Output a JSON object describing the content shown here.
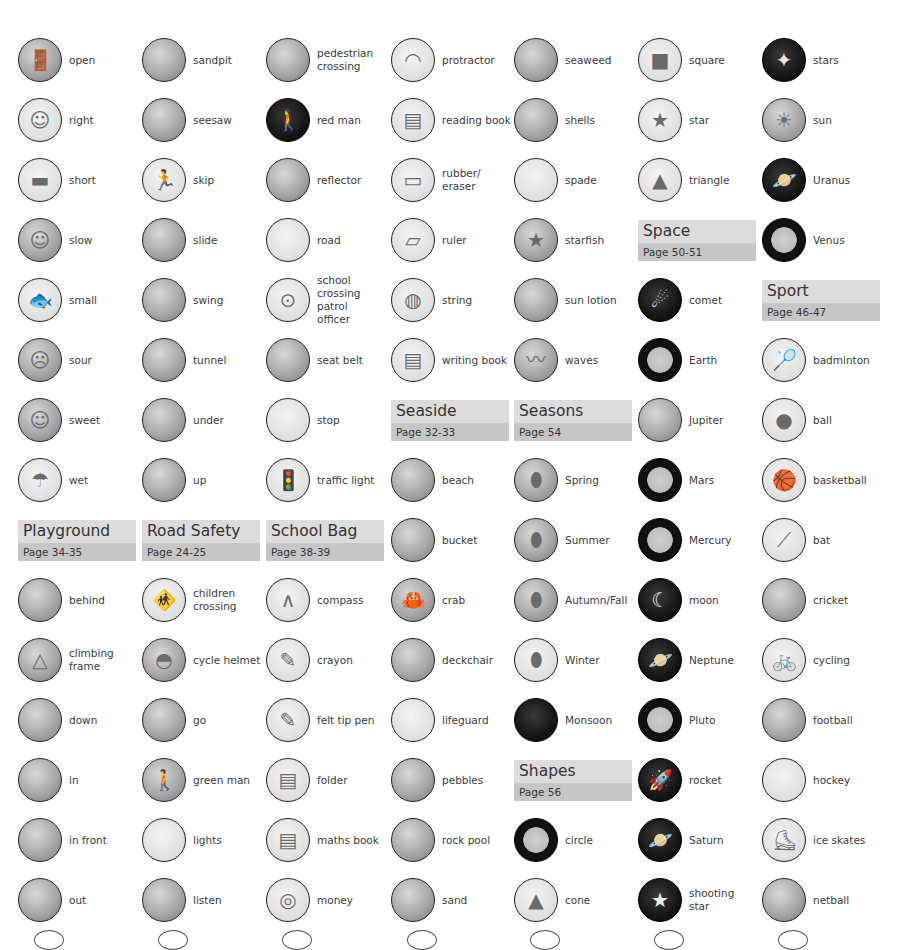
{
  "columns": [
    {
      "entries": [
        {
          "type": "word",
          "label": "open",
          "icon": "open-door-picture",
          "style": "photo",
          "glyph": "🚪"
        },
        {
          "type": "word",
          "label": "right",
          "icon": "right-picture",
          "style": "light",
          "glyph": "☺"
        },
        {
          "type": "word",
          "label": "short",
          "icon": "short-picture",
          "style": "light",
          "glyph": "▬"
        },
        {
          "type": "word",
          "label": "slow",
          "icon": "slow-picture",
          "style": "photo",
          "glyph": "☺"
        },
        {
          "type": "word",
          "label": "small",
          "icon": "small-fish-picture",
          "style": "light",
          "glyph": "🐟"
        },
        {
          "type": "word",
          "label": "sour",
          "icon": "sour-face-picture",
          "style": "photo",
          "glyph": "☹"
        },
        {
          "type": "word",
          "label": "sweet",
          "icon": "sweet-face-picture",
          "style": "photo",
          "glyph": "☺"
        },
        {
          "type": "word",
          "label": "wet",
          "icon": "wet-rain-picture",
          "style": "light",
          "glyph": "☂"
        },
        {
          "type": "section",
          "title": "Playground",
          "page": "Page 34-35"
        },
        {
          "type": "word",
          "label": "behind",
          "icon": "behind-picture",
          "style": "photo",
          "glyph": ""
        },
        {
          "type": "word",
          "label": "climbing\nframe",
          "icon": "climbing-frame-picture",
          "style": "photo",
          "glyph": "△"
        },
        {
          "type": "word",
          "label": "down",
          "icon": "down-slide-picture",
          "style": "photo",
          "glyph": ""
        },
        {
          "type": "word",
          "label": "in",
          "icon": "in-picture",
          "style": "photo",
          "glyph": ""
        },
        {
          "type": "word",
          "label": "in front",
          "icon": "in-front-picture",
          "style": "photo",
          "glyph": ""
        },
        {
          "type": "word",
          "label": "out",
          "icon": "out-picture",
          "style": "photo",
          "glyph": ""
        }
      ]
    },
    {
      "entries": [
        {
          "type": "word",
          "label": "sandpit",
          "icon": "sandpit-picture",
          "style": "photo",
          "glyph": ""
        },
        {
          "type": "word",
          "label": "seesaw",
          "icon": "seesaw-picture",
          "style": "photo",
          "glyph": ""
        },
        {
          "type": "word",
          "label": "skip",
          "icon": "skip-picture",
          "style": "light",
          "glyph": "🏃"
        },
        {
          "type": "word",
          "label": "slide",
          "icon": "slide-picture",
          "style": "photo",
          "glyph": ""
        },
        {
          "type": "word",
          "label": "swing",
          "icon": "swing-picture",
          "style": "photo",
          "glyph": ""
        },
        {
          "type": "word",
          "label": "tunnel",
          "icon": "tunnel-picture",
          "style": "photo",
          "glyph": ""
        },
        {
          "type": "word",
          "label": "under",
          "icon": "under-picture",
          "style": "photo",
          "glyph": ""
        },
        {
          "type": "word",
          "label": "up",
          "icon": "up-picture",
          "style": "photo",
          "glyph": ""
        },
        {
          "type": "section",
          "title": "Road Safety",
          "page": "Page 24-25"
        },
        {
          "type": "word",
          "label": "children\ncrossing",
          "icon": "children-crossing-picture",
          "style": "light",
          "glyph": "🚸"
        },
        {
          "type": "word",
          "label": "cycle helmet",
          "icon": "cycle-helmet-picture",
          "style": "photo",
          "glyph": "◓"
        },
        {
          "type": "word",
          "label": "go",
          "icon": "go-picture",
          "style": "photo",
          "glyph": ""
        },
        {
          "type": "word",
          "label": "green man",
          "icon": "green-man-signal-picture",
          "style": "photo",
          "glyph": "🚶"
        },
        {
          "type": "word",
          "label": "lights",
          "icon": "lights-picture",
          "style": "light",
          "glyph": ""
        },
        {
          "type": "word",
          "label": "listen",
          "icon": "listen-ear-picture",
          "style": "photo",
          "glyph": ""
        }
      ]
    },
    {
      "entries": [
        {
          "type": "word",
          "label": "pedestrian\ncrossing",
          "icon": "pedestrian-crossing-picture",
          "style": "photo",
          "glyph": ""
        },
        {
          "type": "word",
          "label": "red man",
          "icon": "red-man-signal-picture",
          "style": "dark",
          "glyph": "🚶"
        },
        {
          "type": "word",
          "label": "reflector",
          "icon": "reflector-picture",
          "style": "photo",
          "glyph": ""
        },
        {
          "type": "word",
          "label": "road",
          "icon": "road-picture",
          "style": "light",
          "glyph": ""
        },
        {
          "type": "word",
          "label": "school\ncrossing\npatrol\nofficer",
          "icon": "school-crossing-patrol-picture",
          "style": "light",
          "glyph": "⊙"
        },
        {
          "type": "word",
          "label": "seat belt",
          "icon": "seat-belt-picture",
          "style": "photo",
          "glyph": ""
        },
        {
          "type": "word",
          "label": "stop",
          "icon": "stop-picture",
          "style": "light",
          "glyph": ""
        },
        {
          "type": "word",
          "label": "traffic light",
          "icon": "traffic-light-picture",
          "style": "light",
          "glyph": "🚦"
        },
        {
          "type": "section",
          "title": "School Bag",
          "page": "Page 38-39"
        },
        {
          "type": "word",
          "label": "compass",
          "icon": "compass-picture",
          "style": "light",
          "glyph": "∧"
        },
        {
          "type": "word",
          "label": "crayon",
          "icon": "crayon-picture",
          "style": "light",
          "glyph": "✎"
        },
        {
          "type": "word",
          "label": "felt tip pen",
          "icon": "felt-tip-pen-picture",
          "style": "light",
          "glyph": "✎"
        },
        {
          "type": "word",
          "label": "folder",
          "icon": "folder-picture",
          "style": "light",
          "glyph": "▤"
        },
        {
          "type": "word",
          "label": "maths book",
          "icon": "maths-book-picture",
          "style": "light",
          "glyph": "▤"
        },
        {
          "type": "word",
          "label": "money",
          "icon": "money-coins-picture",
          "style": "light",
          "glyph": "◎"
        }
      ]
    },
    {
      "entries": [
        {
          "type": "word",
          "label": "protractor",
          "icon": "protractor-picture",
          "style": "light",
          "glyph": "◠"
        },
        {
          "type": "word",
          "label": "reading book",
          "icon": "reading-book-picture",
          "style": "light",
          "glyph": "▤"
        },
        {
          "type": "word",
          "label": "rubber/\neraser",
          "icon": "rubber-eraser-picture",
          "style": "light",
          "glyph": "▭"
        },
        {
          "type": "word",
          "label": "ruler",
          "icon": "ruler-picture",
          "style": "light",
          "glyph": "▱"
        },
        {
          "type": "word",
          "label": "string",
          "icon": "string-picture",
          "style": "light",
          "glyph": "◍"
        },
        {
          "type": "word",
          "label": "writing book",
          "icon": "writing-book-picture",
          "style": "light",
          "glyph": "▤"
        },
        {
          "type": "section",
          "title": "Seaside",
          "page": "Page 32-33"
        },
        {
          "type": "word",
          "label": "beach",
          "icon": "beach-picture",
          "style": "photo",
          "glyph": ""
        },
        {
          "type": "word",
          "label": "bucket",
          "icon": "bucket-picture",
          "style": "photo",
          "glyph": ""
        },
        {
          "type": "word",
          "label": "crab",
          "icon": "crab-picture",
          "style": "photo",
          "glyph": "🦀"
        },
        {
          "type": "word",
          "label": "deckchair",
          "icon": "deckchair-picture",
          "style": "photo",
          "glyph": ""
        },
        {
          "type": "word",
          "label": "lifeguard",
          "icon": "lifeguard-picture",
          "style": "light",
          "glyph": ""
        },
        {
          "type": "word",
          "label": "pebbles",
          "icon": "pebbles-picture",
          "style": "photo",
          "glyph": ""
        },
        {
          "type": "word",
          "label": "rock pool",
          "icon": "rock-pool-picture",
          "style": "photo",
          "glyph": ""
        },
        {
          "type": "word",
          "label": "sand",
          "icon": "sand-picture",
          "style": "photo",
          "glyph": ""
        }
      ]
    },
    {
      "entries": [
        {
          "type": "word",
          "label": "seaweed",
          "icon": "seaweed-picture",
          "style": "photo",
          "glyph": ""
        },
        {
          "type": "word",
          "label": "shells",
          "icon": "shells-picture",
          "style": "photo",
          "glyph": ""
        },
        {
          "type": "word",
          "label": "spade",
          "icon": "spade-picture",
          "style": "light",
          "glyph": ""
        },
        {
          "type": "word",
          "label": "starfish",
          "icon": "starfish-picture",
          "style": "photo",
          "glyph": "★"
        },
        {
          "type": "word",
          "label": "sun lotion",
          "icon": "sun-lotion-picture",
          "style": "photo",
          "glyph": ""
        },
        {
          "type": "word",
          "label": "waves",
          "icon": "waves-picture",
          "style": "photo",
          "glyph": "〰"
        },
        {
          "type": "section",
          "title": "Seasons",
          "page": "Page 54"
        },
        {
          "type": "word",
          "label": "Spring",
          "icon": "spring-tree-picture",
          "style": "photo",
          "glyph": "⬮"
        },
        {
          "type": "word",
          "label": "Summer",
          "icon": "summer-tree-picture",
          "style": "photo",
          "glyph": "⬮"
        },
        {
          "type": "word",
          "label": "Autumn/Fall",
          "icon": "autumn-tree-picture",
          "style": "photo",
          "glyph": "⬮"
        },
        {
          "type": "word",
          "label": "Winter",
          "icon": "winter-tree-picture",
          "style": "light",
          "glyph": "⬮"
        },
        {
          "type": "word",
          "label": "Monsoon",
          "icon": "monsoon-tree-picture",
          "style": "dark",
          "glyph": ""
        },
        {
          "type": "section",
          "title": "Shapes",
          "page": "Page 56"
        },
        {
          "type": "word",
          "label": "circle",
          "icon": "circle-shape-picture",
          "style": "ring",
          "glyph": ""
        },
        {
          "type": "word",
          "label": "cone",
          "icon": "cone-shape-picture",
          "style": "light",
          "glyph": "▲"
        }
      ]
    },
    {
      "entries": [
        {
          "type": "word",
          "label": "square",
          "icon": "square-shape-picture",
          "style": "light",
          "glyph": "■"
        },
        {
          "type": "word",
          "label": "star",
          "icon": "star-shape-picture",
          "style": "light",
          "glyph": "★"
        },
        {
          "type": "word",
          "label": "triangle",
          "icon": "triangle-shape-picture",
          "style": "light",
          "glyph": "▲"
        },
        {
          "type": "section",
          "title": "Space",
          "page": "Page 50-51"
        },
        {
          "type": "word",
          "label": "comet",
          "icon": "comet-picture",
          "style": "dark",
          "glyph": "☄"
        },
        {
          "type": "word",
          "label": "Earth",
          "icon": "earth-planet-picture",
          "style": "ring",
          "glyph": ""
        },
        {
          "type": "word",
          "label": "Jupiter",
          "icon": "jupiter-planet-picture",
          "style": "photo",
          "glyph": ""
        },
        {
          "type": "word",
          "label": "Mars",
          "icon": "mars-planet-picture",
          "style": "ring",
          "glyph": ""
        },
        {
          "type": "word",
          "label": "Mercury",
          "icon": "mercury-planet-picture",
          "style": "ring",
          "glyph": ""
        },
        {
          "type": "word",
          "label": "moon",
          "icon": "moon-picture",
          "style": "dark",
          "glyph": "☾"
        },
        {
          "type": "word",
          "label": "Neptune",
          "icon": "neptune-planet-picture",
          "style": "dark",
          "glyph": "🪐"
        },
        {
          "type": "word",
          "label": "Pluto",
          "icon": "pluto-planet-picture",
          "style": "ring",
          "glyph": ""
        },
        {
          "type": "word",
          "label": "rocket",
          "icon": "rocket-picture",
          "style": "dark",
          "glyph": "🚀"
        },
        {
          "type": "word",
          "label": "Saturn",
          "icon": "saturn-planet-picture",
          "style": "dark",
          "glyph": "🪐"
        },
        {
          "type": "word",
          "label": "shooting\nstar",
          "icon": "shooting-star-picture",
          "style": "dark",
          "glyph": "★"
        }
      ]
    },
    {
      "entries": [
        {
          "type": "word",
          "label": "stars",
          "icon": "stars-picture",
          "style": "dark",
          "glyph": "✦"
        },
        {
          "type": "word",
          "label": "sun",
          "icon": "sun-picture",
          "style": "photo",
          "glyph": "☀"
        },
        {
          "type": "word",
          "label": "Uranus",
          "icon": "uranus-planet-picture",
          "style": "dark",
          "glyph": "🪐"
        },
        {
          "type": "word",
          "label": "Venus",
          "icon": "venus-planet-picture",
          "style": "ring",
          "glyph": ""
        },
        {
          "type": "section",
          "title": "Sport",
          "page": "Page 46-47"
        },
        {
          "type": "word",
          "label": "badminton",
          "icon": "badminton-picture",
          "style": "light",
          "glyph": "🏸"
        },
        {
          "type": "word",
          "label": "ball",
          "icon": "ball-picture",
          "style": "light",
          "glyph": "●"
        },
        {
          "type": "word",
          "label": "basketball",
          "icon": "basketball-picture",
          "style": "light",
          "glyph": "🏀"
        },
        {
          "type": "word",
          "label": "bat",
          "icon": "cricket-bat-picture",
          "style": "light",
          "glyph": "⟋"
        },
        {
          "type": "word",
          "label": "cricket",
          "icon": "cricket-picture",
          "style": "photo",
          "glyph": ""
        },
        {
          "type": "word",
          "label": "cycling",
          "icon": "cycling-picture",
          "style": "light",
          "glyph": "🚲"
        },
        {
          "type": "word",
          "label": "football",
          "icon": "football-picture",
          "style": "photo",
          "glyph": ""
        },
        {
          "type": "word",
          "label": "hockey",
          "icon": "hockey-picture",
          "style": "light",
          "glyph": ""
        },
        {
          "type": "word",
          "label": "ice skates",
          "icon": "ice-skates-picture",
          "style": "light",
          "glyph": "⛸"
        },
        {
          "type": "word",
          "label": "netball",
          "icon": "netball-picture",
          "style": "photo",
          "glyph": ""
        }
      ]
    }
  ],
  "layout": {
    "col_left": [
      16,
      140,
      264,
      389,
      512,
      636,
      760
    ],
    "row_top": 30,
    "row_pitch": 60
  }
}
